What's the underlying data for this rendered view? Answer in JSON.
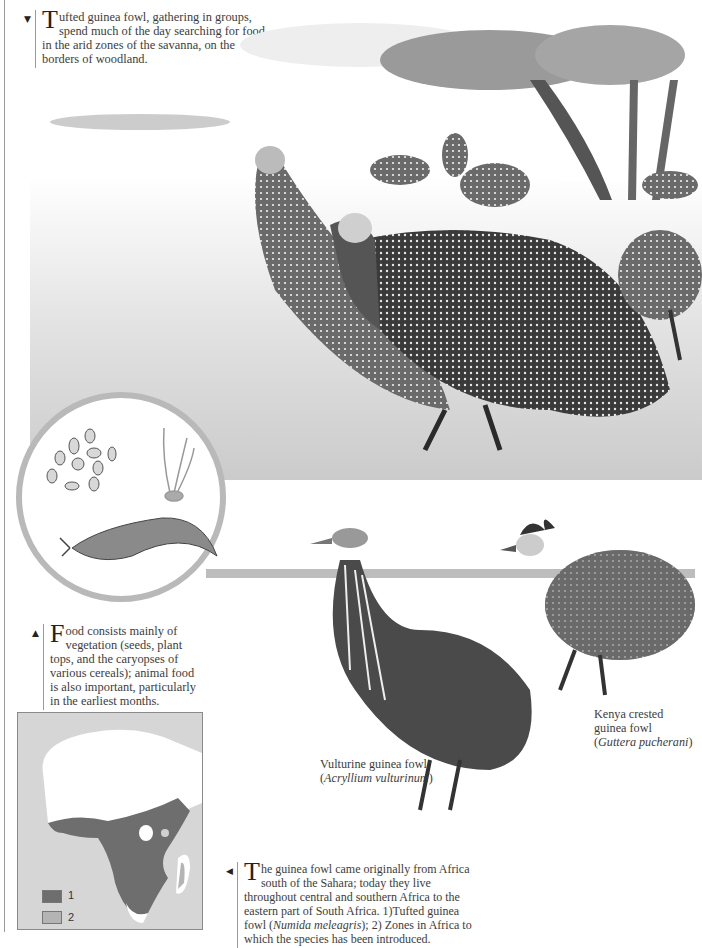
{
  "captions": {
    "top": {
      "marker": "▼",
      "dropcap": "T",
      "text": "ufted guinea fowl, gathering in groups, spend much of the day searching for food in the arid zones of the savanna, on the borders of woodland."
    },
    "food": {
      "marker": "▲",
      "dropcap": "F",
      "text": "ood consists mainly of vegetation (seeds, plant tops, and the caryopses of various cereals); animal food is also important, particularly in the earliest months."
    },
    "distribution": {
      "marker": "◀",
      "dropcap": "T",
      "text_1": "he guinea fowl came originally from Africa south of the Sahara; today they live throughout central and southern Africa to the eastern part of South Africa. 1)Tufted guinea fowl (",
      "species_italic": "Numida meleagris",
      "text_2": "); 2) Zones in Africa to which the species has been introduced."
    }
  },
  "species_labels": {
    "vulturine": {
      "common": "Vulturine guinea fowl",
      "scientific": "Acryllium vulturinum"
    },
    "kenya": {
      "common_1": "Kenya crested",
      "common_2": "guinea fowl",
      "scientific": "Guttera pucherani"
    }
  },
  "map": {
    "legend": [
      {
        "label": "1",
        "color": "#6e6e6e"
      },
      {
        "label": "2",
        "color": "#b4b4b4"
      }
    ],
    "colors": {
      "sea": "#d6d6d6",
      "land": "#ffffff",
      "range": "#6e6e6e",
      "introduced": "#b4b4b4"
    }
  },
  "illustrations": {
    "scene": "savanna-guinea-fowl-flock",
    "food_items": [
      "seeds",
      "plant-tops",
      "slug"
    ]
  }
}
